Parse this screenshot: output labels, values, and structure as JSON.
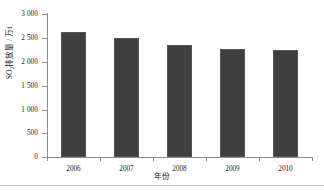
{
  "chart_data": {
    "type": "bar",
    "title": "",
    "subtitle": "",
    "categories": [
      "2006",
      "2007",
      "2008",
      "2009",
      "2010"
    ],
    "values": [
      2620,
      2490,
      2350,
      2270,
      2240
    ],
    "series": [
      {
        "name": "SO2 emissions",
        "values": [
          2620,
          2490,
          2350,
          2270,
          2240
        ]
      }
    ],
    "xlabel": "年份",
    "ylabel": "SO2排放量 / 万t",
    "ylabel_parts": {
      "prefix": "SO",
      "subscript": "2",
      "suffix": "排放量 / 万t"
    },
    "ylim": [
      0,
      3000
    ],
    "ytick_values": [
      3000,
      2500,
      2000,
      1500,
      1000,
      500,
      0
    ],
    "ytick_labels": [
      "3 000",
      "2 500",
      "2 000",
      "1 500",
      "1 000",
      "500",
      "0"
    ],
    "xtick_labels": [
      "2006",
      "2007",
      "2008",
      "2009",
      "2010"
    ],
    "grid": false,
    "legend": "none",
    "bar_color": "#3f3f3f",
    "axis_color": "#8d8d8d",
    "text_color": "#1a1a1a",
    "background": "#ffffff"
  }
}
